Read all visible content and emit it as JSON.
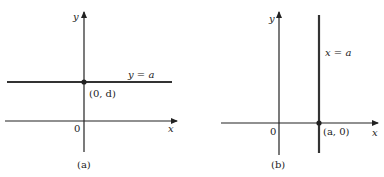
{
  "colors": {
    "background": "#ffffff",
    "axis": "#222222",
    "line": "#333333"
  },
  "panels": [
    {
      "caption": "(a)",
      "x_axis_label": "x",
      "y_axis_label": "y",
      "origin_label": "0",
      "line_label": "y = a",
      "point_label": "(0, d)",
      "line_type": "horizontal"
    },
    {
      "caption": "(b)",
      "x_axis_label": "x",
      "y_axis_label": "y",
      "origin_label": "0",
      "line_label": "x = a",
      "point_label": "(a, 0)",
      "line_type": "vertical"
    }
  ]
}
